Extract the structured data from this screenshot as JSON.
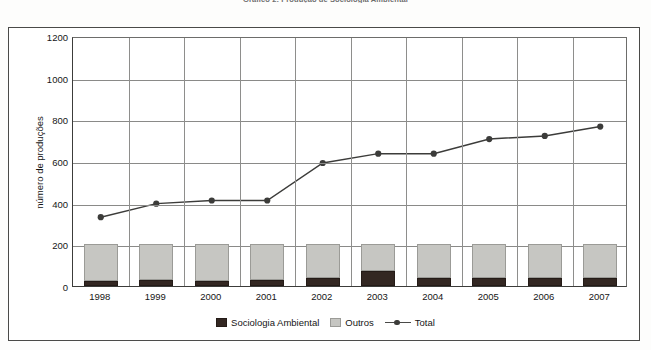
{
  "figure": {
    "caption": "Gráfico 2: Produção de Sociologia Ambiental"
  },
  "chart_data": {
    "type": "bar",
    "subtype": "stacked-bar-with-line",
    "title": "Gráfico 2: Produção de Sociologia Ambiental",
    "xlabel": "",
    "ylabel": "número de produções",
    "ylim": [
      0,
      1200
    ],
    "ytick_step": 200,
    "yticks": [
      "0",
      "200",
      "400",
      "600",
      "800",
      "1000",
      "1200"
    ],
    "grid": "horizontal-and-vertical",
    "legend_position": "bottom-center",
    "categories": [
      "1998",
      "1999",
      "2000",
      "2001",
      "2002",
      "2003",
      "2004",
      "2005",
      "2006",
      "2007"
    ],
    "series": [
      {
        "name": "Sociologia Ambiental",
        "kind": "bar-segment",
        "color": "#332722",
        "values": [
          25,
          30,
          25,
          30,
          40,
          70,
          40,
          38,
          38,
          38
        ]
      },
      {
        "name": "Outros",
        "kind": "bar-segment",
        "color": "#c6c6c2",
        "values": [
          175,
          170,
          175,
          170,
          160,
          130,
          160,
          162,
          162,
          162
        ]
      },
      {
        "name": "Total",
        "kind": "line",
        "color": "#3c3c3a",
        "marker": "circle",
        "values": [
          340,
          405,
          420,
          420,
          600,
          645,
          645,
          715,
          730,
          775
        ]
      }
    ]
  },
  "legend": {
    "items": [
      {
        "label": "Sociologia Ambiental",
        "marker": "dark-square-swatch"
      },
      {
        "label": "Outros",
        "marker": "gray-square-swatch"
      },
      {
        "label": "Total",
        "marker": "line-with-dot"
      }
    ]
  },
  "colors": {
    "sociologia_ambiental": "#332722",
    "outros": "#c6c6c2",
    "total_line": "#3c3c3a",
    "frame": "#4a4a48",
    "gridline": "#8a8a88",
    "background": "#ffffff"
  }
}
